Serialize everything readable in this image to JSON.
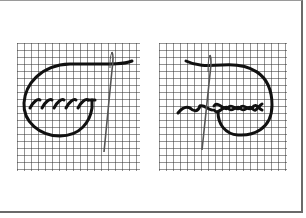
{
  "figure": {
    "panels": [
      {
        "name": "left-panel",
        "stitch": "whipped running stitch",
        "grid": {
          "x": 17,
          "y": 43,
          "w": 123,
          "h": 130,
          "cells": 18
        }
      },
      {
        "name": "right-panel",
        "stitch": "interlaced running stitch",
        "grid": {
          "x": 159,
          "y": 43,
          "w": 128,
          "h": 130,
          "cells": 18
        }
      }
    ],
    "colors": {
      "background": "#ffffff",
      "grid": "#2a2a2a",
      "thread": "#1a1a1a",
      "needle": "#555555",
      "frame": "#6a6a6a"
    }
  }
}
